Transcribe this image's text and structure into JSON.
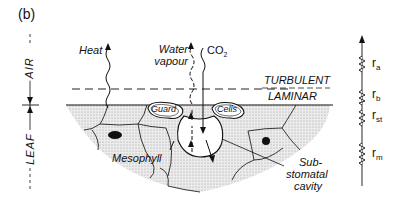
{
  "figure": {
    "panel_label": "(b)",
    "type": "leaf cross-section with resistance network"
  },
  "zones": {
    "air_label": "AIR",
    "leaf_label": "LEAF"
  },
  "boundary_layers": {
    "upper": "TURBULENT",
    "lower": "LAMINAR"
  },
  "fluxes": {
    "heat": "Heat",
    "water_line1": "Water",
    "water_line2": "vapour",
    "co2_main": "CO",
    "co2_sub": "2"
  },
  "cells": {
    "guard": "Guard",
    "cells": "Cells",
    "mesophyll": "Mesophyll",
    "substomatal_line1": "Sub-",
    "substomatal_line2": "stomatal",
    "substomatal_line3": "cavity"
  },
  "resistances": [
    {
      "symbol": "r",
      "sub": "a"
    },
    {
      "symbol": "r",
      "sub": "b"
    },
    {
      "symbol": "r",
      "sub": "st"
    },
    {
      "symbol": "r",
      "sub": "m"
    }
  ],
  "colors": {
    "ink": "#111111",
    "stipple": "#d8d8d8",
    "background": "#ffffff"
  }
}
